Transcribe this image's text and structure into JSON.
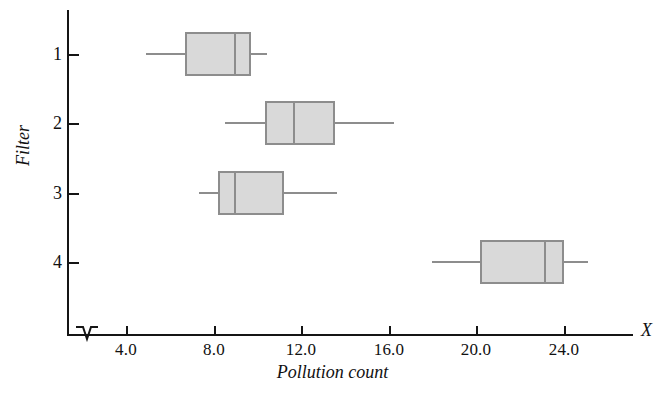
{
  "chart_data": {
    "type": "box",
    "title": "",
    "xlabel": "Pollution count",
    "ylabel": "Filter",
    "axis_variable": "X",
    "xlim": [
      2.5,
      27.5
    ],
    "xticks": [
      4.0,
      8.0,
      12.0,
      16.0,
      20.0,
      24.0
    ],
    "xtick_labels": [
      "4.0",
      "8.0",
      "12.0",
      "16.0",
      "20.0",
      "24.0"
    ],
    "yticks": [
      1,
      2,
      3,
      4
    ],
    "ytick_labels": [
      "1",
      "2",
      "3",
      "4"
    ],
    "grid": false,
    "legend": null,
    "axis_break": true,
    "orientation": "horizontal",
    "categories": [
      "1",
      "2",
      "3",
      "4"
    ],
    "boxes": [
      {
        "category": "1",
        "whisker_low": 4.9,
        "q1": 6.7,
        "median": 8.9,
        "q3": 9.7,
        "whisker_high": 10.4
      },
      {
        "category": "2",
        "whisker_low": 8.5,
        "q1": 10.3,
        "median": 11.6,
        "q3": 13.5,
        "whisker_high": 16.2
      },
      {
        "category": "3",
        "whisker_low": 7.3,
        "q1": 8.2,
        "median": 8.9,
        "q3": 11.2,
        "whisker_high": 13.6
      },
      {
        "category": "4",
        "whisker_low": 17.9,
        "q1": 20.1,
        "median": 23.0,
        "q3": 23.9,
        "whisker_high": 25.0
      }
    ]
  },
  "labels": {
    "xtick_0": "4.0",
    "xtick_1": "8.0",
    "xtick_2": "12.0",
    "xtick_3": "16.0",
    "xtick_4": "20.0",
    "xtick_5": "24.0",
    "ytick_0": "1",
    "ytick_1": "2",
    "ytick_2": "3",
    "ytick_3": "4",
    "x_axis_title": "Pollution count",
    "y_axis_title": "Filter",
    "axis_variable": "X"
  },
  "colors": {
    "box_fill": "#d9d9d9",
    "box_stroke": "#8d8d8d",
    "axis": "#151515",
    "text": "#111111",
    "background": "#ffffff"
  }
}
